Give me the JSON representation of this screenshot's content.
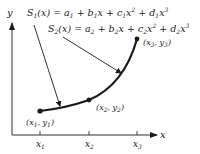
{
  "diagram": {
    "axes": {
      "x_label": "x",
      "y_label": "y",
      "ticks": [
        {
          "label": "x",
          "sub": "1",
          "pos": 40
        },
        {
          "label": "x",
          "sub": "2",
          "pos": 89
        },
        {
          "label": "x",
          "sub": "3",
          "pos": 137
        }
      ]
    },
    "points": [
      {
        "label": "(x1, y1)",
        "x": 40,
        "y": 111
      },
      {
        "label": "(x2, y2)",
        "x": 89,
        "y": 100
      },
      {
        "label": "(x3, y3)",
        "x": 137,
        "y": 39
      }
    ],
    "equations": {
      "s1": "S1(x) = a1 + b1x + c1x^2 + d1x^3",
      "s2": "S2(x) = a2 + b2x + c2x^2 + d2x^3"
    },
    "colors": {
      "ink": "#1a1a1a",
      "background": "#ffffff"
    }
  }
}
